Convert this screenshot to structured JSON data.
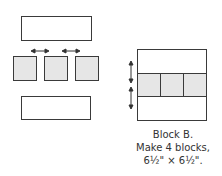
{
  "diagram": {
    "left_assembly": {
      "top_rectangle": "solid-white",
      "squares": [
        "square-1",
        "square-2",
        "square-3"
      ],
      "bottom_rectangle": "solid-white",
      "arrows": [
        "press-seams-arrow-1",
        "press-seams-arrow-2"
      ]
    },
    "right_block": {
      "rows": [
        "top-white",
        "three-squares",
        "bottom-white"
      ],
      "arrows": [
        "press-up-arrow",
        "press-down-arrow"
      ]
    },
    "caption": {
      "line1": "Block B.",
      "line2": "Make 4 blocks,",
      "line3": "6½\" × 6½\"."
    },
    "colors": {
      "outline": "#3a3a3a",
      "square_fill": "#e6e6e6",
      "background": "#ffffff"
    }
  }
}
